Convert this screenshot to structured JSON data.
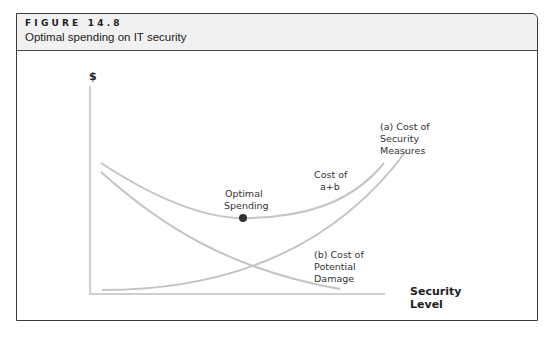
{
  "figure": {
    "label": "FIGURE 14.8",
    "title": "Optimal spending on IT security"
  },
  "diagram": {
    "y_axis_label": "$",
    "x_axis_label_line1": "Security",
    "x_axis_label_line2": "Level",
    "curves": {
      "security_measures": {
        "line1": "(a) Cost of",
        "line2": "Security",
        "line3": "Measures"
      },
      "potential_damage": {
        "line1": "(b) Cost of",
        "line2": "Potential",
        "line3": "Damage"
      },
      "total": {
        "line1": "Cost of",
        "line2": "a+b"
      }
    },
    "optimal_point": {
      "line1": "Optimal",
      "line2": "Spending"
    },
    "colors": {
      "curve": "#c4c4c4",
      "axis": "#cfcfcf",
      "point": "#333333"
    }
  }
}
